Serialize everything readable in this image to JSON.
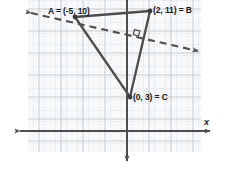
{
  "figure": {
    "axis_label_x": "x",
    "colors": {
      "grid_minor": "#d8dce0",
      "grid_major": "#c2c7cc",
      "grid_fill": "#f7f8f9",
      "axis": "#4d4d4d",
      "triangle": "#4d4d4d",
      "dashed_line": "#4d4d4d",
      "label_text": "#1a1a1a"
    },
    "labels": {
      "a": "A = (-5, 10)",
      "b": "(2, 11) = B",
      "c": "(0, 3) = C"
    },
    "points": [
      {
        "name": "A",
        "label": "A = (-5, 10)",
        "x": -5,
        "y": 10
      },
      {
        "name": "B",
        "label": "(2, 11) = B",
        "x": 2,
        "y": 11
      },
      {
        "name": "C",
        "label": "(0, 3) = C",
        "x": 0,
        "y": 3
      }
    ],
    "segments": [
      {
        "name": "AB",
        "from": "A",
        "to": "B",
        "style": "solid"
      },
      {
        "name": "BC",
        "from": "B",
        "to": "C",
        "style": "solid"
      },
      {
        "name": "CA",
        "from": "C",
        "to": "A",
        "style": "solid"
      }
    ],
    "dashed_line": {
      "name": "altitude-through-A",
      "style": "dashed",
      "arrows": "both",
      "passes_through": "A",
      "perpendicular_to": "BC",
      "right_angle_marker": true
    },
    "axes": {
      "x_axis": {
        "arrows": "both"
      },
      "y_axis": {
        "arrows": "down"
      }
    }
  }
}
